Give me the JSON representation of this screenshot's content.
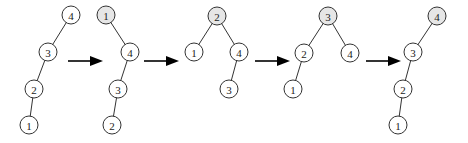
{
  "diagram": {
    "title": "",
    "node_radius": 9,
    "colors": {
      "node_fill": "#ffffff",
      "shaded_fill": "#e6e6e6",
      "stroke": "#333333",
      "arrow": "#000000"
    },
    "trees": [
      {
        "id": "tree-1",
        "nodes": [
          {
            "key": "4",
            "x": 71,
            "y": 15,
            "shaded": false
          },
          {
            "key": "3",
            "x": 48,
            "y": 52,
            "shaded": false
          },
          {
            "key": "2",
            "x": 34,
            "y": 89,
            "shaded": false
          },
          {
            "key": "1",
            "x": 29,
            "y": 125,
            "shaded": false
          }
        ],
        "edges": [
          [
            "4",
            "3"
          ],
          [
            "3",
            "2"
          ],
          [
            "2",
            "1"
          ]
        ]
      },
      {
        "id": "tree-2",
        "nodes": [
          {
            "key": "1",
            "x": 106,
            "y": 15,
            "shaded": true
          },
          {
            "key": "4",
            "x": 130,
            "y": 52,
            "shaded": false
          },
          {
            "key": "3",
            "x": 118,
            "y": 89,
            "shaded": false
          },
          {
            "key": "2",
            "x": 112,
            "y": 125,
            "shaded": false
          }
        ],
        "edges": [
          [
            "1",
            "4"
          ],
          [
            "4",
            "3"
          ],
          [
            "3",
            "2"
          ]
        ]
      },
      {
        "id": "tree-3",
        "nodes": [
          {
            "key": "2",
            "x": 217,
            "y": 16,
            "shaded": true
          },
          {
            "key": "1",
            "x": 194,
            "y": 52,
            "shaded": false
          },
          {
            "key": "4",
            "x": 239,
            "y": 52,
            "shaded": false
          },
          {
            "key": "3",
            "x": 229,
            "y": 89,
            "shaded": false
          }
        ],
        "edges": [
          [
            "2",
            "1"
          ],
          [
            "2",
            "4"
          ],
          [
            "4",
            "3"
          ]
        ]
      },
      {
        "id": "tree-4",
        "nodes": [
          {
            "key": "3",
            "x": 328,
            "y": 16,
            "shaded": true
          },
          {
            "key": "2",
            "x": 304,
            "y": 53,
            "shaded": false
          },
          {
            "key": "4",
            "x": 350,
            "y": 53,
            "shaded": false
          },
          {
            "key": "1",
            "x": 293,
            "y": 89,
            "shaded": false
          }
        ],
        "edges": [
          [
            "3",
            "2"
          ],
          [
            "3",
            "4"
          ],
          [
            "2",
            "1"
          ]
        ]
      },
      {
        "id": "tree-5",
        "nodes": [
          {
            "key": "4",
            "x": 437,
            "y": 16,
            "shaded": true
          },
          {
            "key": "3",
            "x": 413,
            "y": 52,
            "shaded": false
          },
          {
            "key": "2",
            "x": 403,
            "y": 89,
            "shaded": false
          },
          {
            "key": "1",
            "x": 398,
            "y": 125,
            "shaded": false
          }
        ],
        "edges": [
          [
            "4",
            "3"
          ],
          [
            "3",
            "2"
          ],
          [
            "2",
            "1"
          ]
        ]
      }
    ],
    "arrows": [
      {
        "x1": 68,
        "x2": 103,
        "y": 61
      },
      {
        "x1": 144,
        "x2": 179,
        "y": 61
      },
      {
        "x1": 255,
        "x2": 290,
        "y": 61
      },
      {
        "x1": 366,
        "x2": 401,
        "y": 61
      }
    ]
  }
}
